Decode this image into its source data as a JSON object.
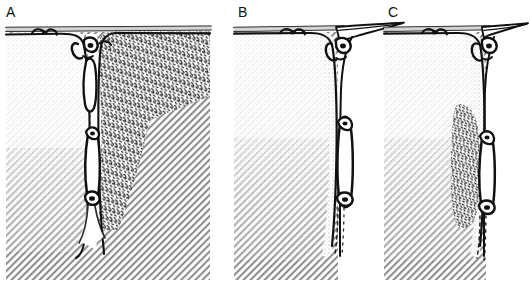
{
  "figure": {
    "kind": "three-panel histological cross-section line drawing",
    "background_color": "#ffffff",
    "ink_color": "#111111",
    "width_px": 527,
    "height_px": 293,
    "panel_count": 3
  },
  "panels": [
    {
      "id": "A",
      "label": "A",
      "left_px": 0,
      "width_px": 216,
      "description": "Deep cleft/sulcus extending to full depth; left block is stippled-over-hatched tissue, right block is dense fleck-textured inflamed tissue; elongated vessel lumen outlined in the cleft at mid and lower depth.",
      "regions": [
        {
          "name": "surface-membrane",
          "texture": "double-line band",
          "position": "top"
        },
        {
          "name": "left-tissue-block",
          "texture": "diagonal-hatch",
          "overlay": "fine-stipple"
        },
        {
          "name": "right-tissue-block",
          "texture": "dense-flecks"
        },
        {
          "name": "central-cleft",
          "texture": "outline",
          "depth": "full"
        },
        {
          "name": "vessel-lumen-upper",
          "texture": "outline-white"
        },
        {
          "name": "vessel-lumen-lower",
          "texture": "outline-white"
        }
      ]
    },
    {
      "id": "B",
      "label": "B",
      "left_px": 232,
      "width_px": 140,
      "description": "Shallower marginal cleft at the right edge of the tissue block; membrane flares out to the right as a tapered free flap; stipple gradient down the right flank; single elongated vessel lumen at mid depth.",
      "regions": [
        {
          "name": "surface-membrane",
          "texture": "double-line band",
          "position": "top"
        },
        {
          "name": "membrane-free-flap",
          "texture": "tapered-outline",
          "direction": "right"
        },
        {
          "name": "tissue-block",
          "texture": "diagonal-hatch",
          "overlay": "fine-stipple"
        },
        {
          "name": "marginal-cleft",
          "texture": "outline",
          "depth": "partial"
        },
        {
          "name": "vessel-lumen",
          "texture": "outline-white"
        }
      ]
    },
    {
      "id": "C",
      "label": "C",
      "left_px": 382,
      "width_px": 145,
      "description": "Marginal cleft with a band of dense fleck-textured inflammatory tissue along the cleft wall; membrane flares right as a tapered free flap; vessel lumen outlined at mid-lower depth.",
      "regions": [
        {
          "name": "surface-membrane",
          "texture": "double-line band",
          "position": "top"
        },
        {
          "name": "membrane-free-flap",
          "texture": "tapered-outline",
          "direction": "right"
        },
        {
          "name": "tissue-block",
          "texture": "diagonal-hatch",
          "overlay": "fine-stipple"
        },
        {
          "name": "infiltrate-band",
          "texture": "dense-flecks"
        },
        {
          "name": "marginal-cleft",
          "texture": "outline",
          "depth": "partial"
        },
        {
          "name": "vessel-lumen",
          "texture": "outline-white"
        }
      ]
    }
  ]
}
